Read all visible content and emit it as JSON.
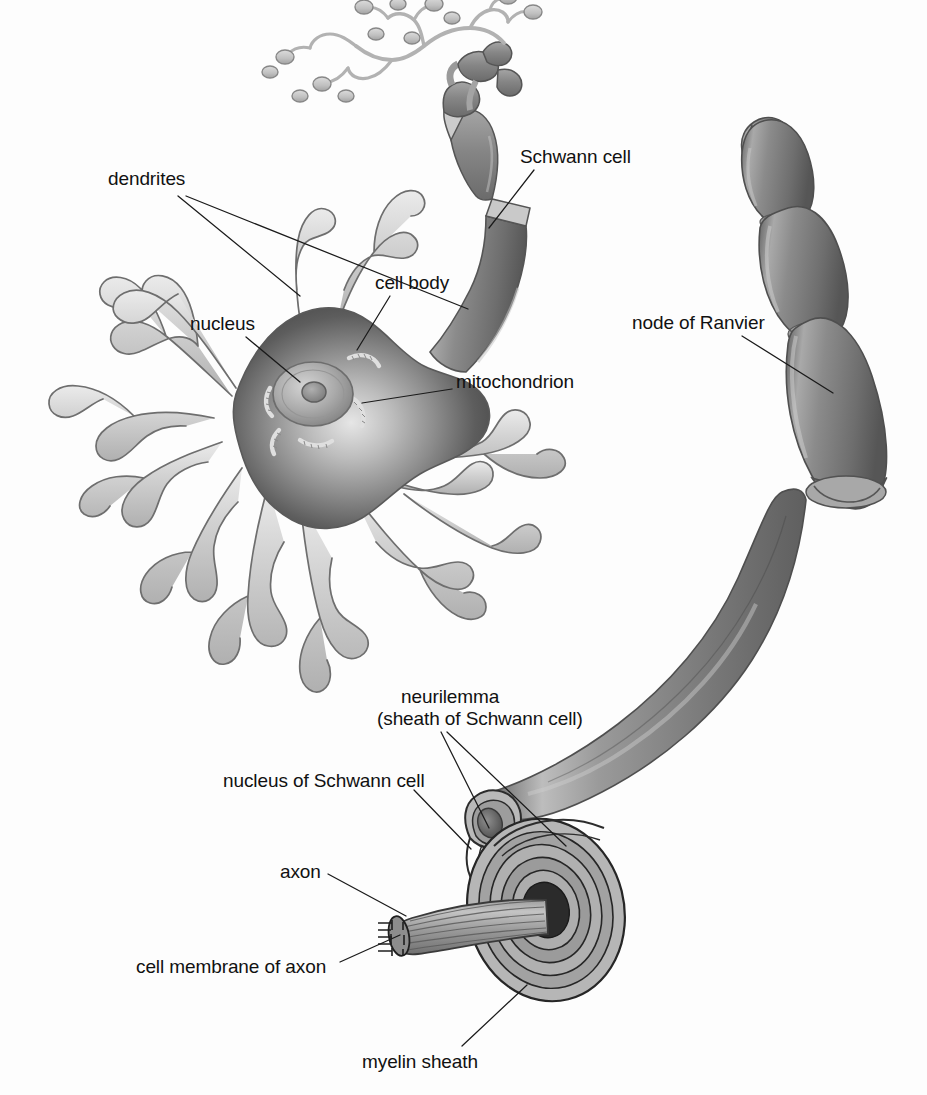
{
  "figure": {
    "background_color": "#fdfdfd",
    "ink_color": "#111111",
    "width": 927,
    "height": 1095
  },
  "palette": {
    "dendrite_fill": "#c9c9c9",
    "dendrite_light": "#e3e3e3",
    "dendrite_outline": "#6e6e6e",
    "soma_dark": "#4a4a4a",
    "soma_mid": "#8f8f8f",
    "soma_light": "#d8d8d8",
    "nucleus_fill": "#a8a8a8",
    "nucleolus_fill": "#8a8a8a",
    "myelin_dark": "#6f6f6f",
    "myelin_mid": "#8d8d8d",
    "myelin_light": "#b4b4b4",
    "myelin_highlight": "#d2d2d2",
    "axon_core": "#2a2a2a",
    "schwann_fill": "#8c8c8c",
    "terminal_fill": "#bcbcbc",
    "leader_line": "#1a1a1a"
  },
  "labels": [
    {
      "id": "dendrites",
      "text": "dendrites",
      "x": 108,
      "y": 168,
      "align": "left",
      "leaders": [
        {
          "from": [
            178,
            196
          ],
          "to": [
            300,
            296
          ]
        },
        {
          "from": [
            186,
            196
          ],
          "to": [
            468,
            309
          ]
        }
      ]
    },
    {
      "id": "schwann-cell",
      "text": "Schwann cell",
      "x": 520,
      "y": 146,
      "align": "left",
      "leaders": [
        {
          "from": [
            534,
            170
          ],
          "to": [
            489,
            228
          ]
        }
      ]
    },
    {
      "id": "cell-body",
      "text": "cell body",
      "x": 375,
      "y": 272,
      "align": "left",
      "leaders": [
        {
          "from": [
            390,
            296
          ],
          "to": [
            357,
            350
          ]
        }
      ]
    },
    {
      "id": "nucleus",
      "text": "nucleus",
      "x": 190,
      "y": 313,
      "align": "left",
      "leaders": [
        {
          "from": [
            246,
            337
          ],
          "to": [
            300,
            382
          ]
        }
      ]
    },
    {
      "id": "mitochondrion",
      "text": "mitochondrion",
      "x": 456,
      "y": 371,
      "align": "left",
      "leaders": [
        {
          "from": [
            452,
            389
          ],
          "to": [
            362,
            403
          ]
        }
      ]
    },
    {
      "id": "node-of-ranvier",
      "text": "node of Ranvier",
      "x": 632,
      "y": 312,
      "align": "left",
      "leaders": [
        {
          "from": [
            742,
            336
          ],
          "to": [
            833,
            393
          ]
        }
      ]
    },
    {
      "id": "neurilemma",
      "text": "neurilemma",
      "x": 401,
      "y": 686,
      "align": "left",
      "leaders": [
        {
          "from": [
            441,
            732
          ],
          "to": [
            489,
            828
          ]
        },
        {
          "from": [
            447,
            732
          ],
          "to": [
            566,
            846
          ]
        }
      ]
    },
    {
      "id": "neurilemma-sub",
      "text": "(sheath of Schwann cell)",
      "x": 377,
      "y": 708,
      "align": "left",
      "leaders": []
    },
    {
      "id": "nucleus-of-schwann-cell",
      "text": "nucleus of Schwann cell",
      "x": 223,
      "y": 770,
      "align": "left",
      "leaders": [
        {
          "from": [
            414,
            790
          ],
          "to": [
            471,
            849
          ]
        }
      ]
    },
    {
      "id": "axon",
      "text": "axon",
      "x": 280,
      "y": 861,
      "align": "left",
      "leaders": [
        {
          "from": [
            328,
            874
          ],
          "to": [
            406,
            916
          ]
        }
      ]
    },
    {
      "id": "cell-membrane-of-axon",
      "text": "cell membrane of axon",
      "x": 136,
      "y": 956,
      "align": "left",
      "leaders": [
        {
          "from": [
            340,
            962
          ],
          "to": [
            400,
            935
          ]
        }
      ]
    },
    {
      "id": "myelin-sheath",
      "text": "myelin sheath",
      "x": 362,
      "y": 1051,
      "align": "left",
      "leaders": [
        {
          "from": [
            462,
            1046
          ],
          "to": [
            527,
            985
          ]
        }
      ]
    }
  ],
  "structures": [
    {
      "id": "soma",
      "name": "cell body (soma)"
    },
    {
      "id": "nucleus",
      "name": "nucleus"
    },
    {
      "id": "nucleolus",
      "name": "nucleolus"
    },
    {
      "id": "mitochondria",
      "name": "mitochondria",
      "count": 5
    },
    {
      "id": "dendrite-tree",
      "name": "dendrites",
      "count": 7
    },
    {
      "id": "axon-hillock",
      "name": "axon hillock"
    },
    {
      "id": "myelinated-axon-upper",
      "name": "myelinated axon with Schwann cells",
      "segments": 5
    },
    {
      "id": "axon-terminals",
      "name": "axon terminals / synaptic end bulbs"
    },
    {
      "id": "myelinated-axon-right",
      "name": "myelinated axon trunk",
      "segments": 4
    },
    {
      "id": "node-of-ranvier",
      "name": "nodes of Ranvier",
      "count": 3
    },
    {
      "id": "axon-cutaway",
      "name": "cut-away cross-section of myelinated axon"
    },
    {
      "id": "myelin-lamellae",
      "name": "concentric myelin lamellae",
      "count": 5
    },
    {
      "id": "schwann-nucleus",
      "name": "nucleus of Schwann cell"
    },
    {
      "id": "axon-bundle",
      "name": "exposed axon with cell membrane"
    }
  ]
}
